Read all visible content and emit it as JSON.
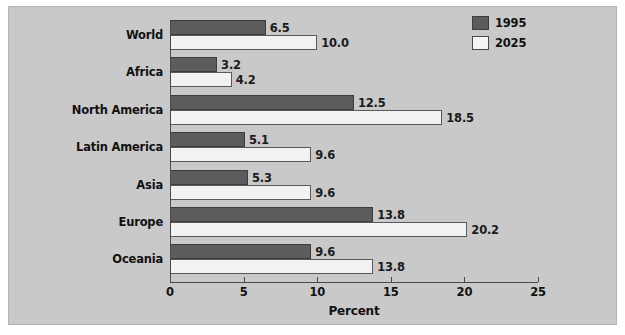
{
  "chart_data": {
    "type": "bar",
    "orientation": "horizontal",
    "title": "",
    "xlabel": "Percent",
    "ylabel": "",
    "xlim": [
      0,
      25
    ],
    "xticks": [
      0,
      5,
      10,
      15,
      20,
      25
    ],
    "xtick_labels": [
      "0",
      "5",
      "10",
      "15",
      "20",
      "25"
    ],
    "grid": false,
    "legend_position": "top-right",
    "categories": [
      "World",
      "Africa",
      "North America",
      "Latin America",
      "Asia",
      "Europe",
      "Oceania"
    ],
    "series": [
      {
        "name": "1995",
        "color": "#5c5c5c",
        "values": [
          6.5,
          3.2,
          12.5,
          5.1,
          5.3,
          13.8,
          9.6
        ],
        "value_labels": [
          "6.5",
          "3.2",
          "12.5",
          "5.1",
          "5.3",
          "13.8",
          "9.6"
        ]
      },
      {
        "name": "2025",
        "color": "#f2f2f2",
        "values": [
          10.0,
          4.2,
          18.5,
          9.6,
          9.6,
          20.2,
          13.8
        ],
        "value_labels": [
          "10.0",
          "4.2",
          "18.5",
          "9.6",
          "9.6",
          "20.2",
          "13.8"
        ]
      }
    ]
  },
  "legend": {
    "items": [
      {
        "label": "1995",
        "swatch": "dark-gray-swatch"
      },
      {
        "label": "2025",
        "swatch": "white-swatch"
      }
    ]
  },
  "axis": {
    "x_title": "Percent"
  },
  "colors": {
    "panel_background": "#c9c9c9",
    "series_1995": "#5c5c5c",
    "series_2025": "#f2f2f2",
    "axis": "#4a4a4a",
    "text": "#111111"
  }
}
